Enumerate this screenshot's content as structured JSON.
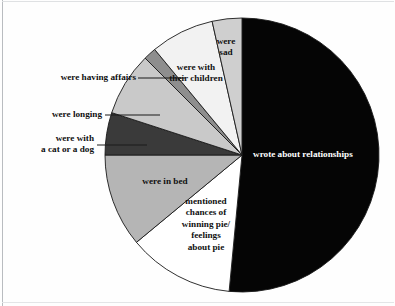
{
  "figure": {
    "background_color": "#fefefe",
    "frame_color": "#b9bcc0"
  },
  "chart_data": {
    "type": "pie",
    "title": "",
    "subtitle": "",
    "xlabel": "",
    "ylabel": "",
    "legend_position": "none",
    "grid": false,
    "units": "percent",
    "start_angle_deg": 0,
    "direction": "clockwise",
    "center_px": [
      242,
      155
    ],
    "radius_px": 137,
    "labels": [
      "wrote about relationships",
      "mentioned chances of winning pie/ feelings about pie",
      "were in bed",
      "were with a cat or a dog",
      "were longing",
      "were having affairs",
      "were with their children",
      "were sad"
    ],
    "values": [
      51.5,
      12.5,
      11.0,
      5.0,
      7.5,
      1.5,
      7.5,
      3.5
    ],
    "colors": [
      "#050505",
      "#ffffff",
      "#b5b5b5",
      "#3a3a3a",
      "#c9c9c9",
      "#8e8e8e",
      "#f2f2f2",
      "#cfcfcf"
    ],
    "slice_edge_color": "#1a1a1a"
  },
  "slices": [
    {
      "key": "relationships",
      "label": "wrote about relationships",
      "value": 51.5,
      "color": "#050505",
      "label_color": "#ffffff",
      "label_placement": "inside"
    },
    {
      "key": "pie-chances",
      "label_lines": [
        "mentioned",
        "chances of",
        "winning pie/",
        "feelings",
        "about pie"
      ],
      "value": 12.5,
      "color": "#ffffff",
      "label_color": "#111111",
      "label_placement": "inside"
    },
    {
      "key": "in-bed",
      "label": "were in bed",
      "value": 11.0,
      "color": "#b5b5b5",
      "label_color": "#111111",
      "label_placement": "inside"
    },
    {
      "key": "cat-or-dog",
      "label_lines": [
        "were with",
        "a cat or a dog"
      ],
      "value": 5.0,
      "color": "#3a3a3a",
      "label_color": "#111111",
      "label_placement": "callout-left"
    },
    {
      "key": "longing",
      "label": "were longing",
      "value": 7.5,
      "color": "#c9c9c9",
      "label_color": "#111111",
      "label_placement": "callout-left"
    },
    {
      "key": "having-affairs",
      "label": "were having affairs",
      "value": 1.5,
      "color": "#8e8e8e",
      "label_color": "#111111",
      "label_placement": "callout-left"
    },
    {
      "key": "their-children",
      "label_lines": [
        "were with",
        "their children"
      ],
      "value": 7.5,
      "color": "#f2f2f2",
      "label_color": "#111111",
      "label_placement": "inside"
    },
    {
      "key": "sad",
      "label_lines": [
        "were",
        "sad"
      ],
      "value": 3.5,
      "color": "#cfcfcf",
      "label_color": "#111111",
      "label_placement": "inside"
    }
  ],
  "labels_text": {
    "relationships": "wrote about relationships",
    "in_bed": "were in bed",
    "longing": "were longing",
    "having_affairs": "were having affairs",
    "cat_dog_line1": "were with",
    "cat_dog_line2": "a cat or a dog",
    "children_line1": "were with",
    "children_line2": "their children",
    "sad_line1": "were",
    "sad_line2": "sad",
    "pie_line1": "mentioned",
    "pie_line2": "chances of",
    "pie_line3": "winning pie/",
    "pie_line4": "feelings",
    "pie_line5": "about pie"
  }
}
